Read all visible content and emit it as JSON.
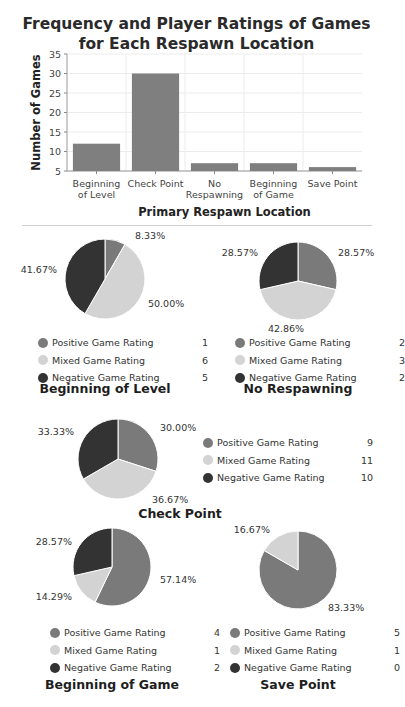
{
  "chart_data": [
    {
      "type": "bar",
      "title": "Frequency and Player Ratings of Games for Each Respawn Location",
      "title_lines": [
        "Frequency and Player Ratings of Games",
        "for Each Respawn Location"
      ],
      "categories": [
        "Beginning of Level",
        "Check Point",
        "No Respawning",
        "Beginning of Game",
        "Save Point"
      ],
      "category_lines": [
        [
          "Beginning",
          "of Level"
        ],
        [
          "Check Point"
        ],
        [
          "No",
          "Respawning"
        ],
        [
          "Beginning",
          "of Game"
        ],
        [
          "Save Point"
        ]
      ],
      "values": [
        12,
        30,
        7,
        7,
        6
      ],
      "xlabel": "Primary Respawn Location",
      "ylabel": "Number of Games",
      "ylim": [
        5,
        35
      ],
      "yticks": [
        5,
        10,
        15,
        20,
        25,
        30,
        35
      ],
      "grid": true,
      "bar_color": "#7f7f7f"
    },
    {
      "type": "pie",
      "title": "Beginning of Level",
      "labels": [
        "Positive Game Rating",
        "Mixed Game Rating",
        "Negative Game Rating"
      ],
      "values": [
        1,
        6,
        5
      ],
      "percent_labels": [
        "8.33%",
        "50.00%",
        "41.67%"
      ]
    },
    {
      "type": "pie",
      "title": "No Respawning",
      "labels": [
        "Positive Game Rating",
        "Mixed Game Rating",
        "Negative Game Rating"
      ],
      "values": [
        2,
        3,
        2
      ],
      "percent_labels": [
        "28.57%",
        "42.86%",
        "28.57%"
      ]
    },
    {
      "type": "pie",
      "title": "Check Point",
      "labels": [
        "Positive Game Rating",
        "Mixed Game Rating",
        "Negative Game Rating"
      ],
      "values": [
        9,
        11,
        10
      ],
      "percent_labels": [
        "30.00%",
        "36.67%",
        "33.33%"
      ]
    },
    {
      "type": "pie",
      "title": "Beginning of Game",
      "labels": [
        "Positive Game Rating",
        "Mixed Game Rating",
        "Negative Game Rating"
      ],
      "values": [
        4,
        1,
        2
      ],
      "percent_labels": [
        "57.14%",
        "14.29%",
        "28.57%"
      ]
    },
    {
      "type": "pie",
      "title": "Save Point",
      "labels": [
        "Positive Game Rating",
        "Mixed Game Rating",
        "Negative Game Rating"
      ],
      "values": [
        5,
        1,
        0
      ],
      "percent_labels": [
        "83.33%",
        "16.67%",
        ""
      ]
    }
  ],
  "colors": {
    "positive": "#7a7a7a",
    "mixed": "#d3d3d3",
    "negative": "#333333",
    "bar": "#7f7f7f",
    "grid": "#ececec"
  }
}
